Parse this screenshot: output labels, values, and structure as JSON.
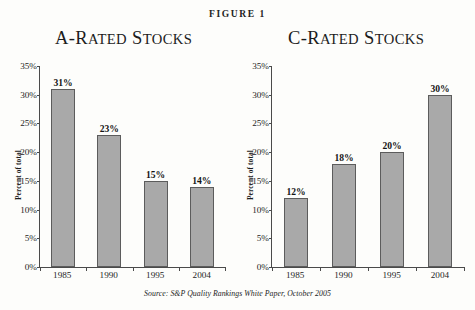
{
  "figure": {
    "label": "FIGURE 1",
    "source_note": "Source: S&P Quality Rankings White Paper, October 2005"
  },
  "panels": [
    {
      "title_lead": "A-R",
      "title_small_1": "ATED",
      "title_mid": " S",
      "title_small_2": "TOCKS",
      "title_plain": "A-Rated Stocks"
    },
    {
      "title_lead": "C-R",
      "title_small_1": "ATED",
      "title_mid": " S",
      "title_small_2": "TOCKS",
      "title_plain": "C-Rated Stocks"
    }
  ],
  "axis": {
    "ylabel": "Percent of total",
    "yticks": [
      "35%",
      "30%",
      "25%",
      "20%",
      "15%",
      "10%",
      "5%",
      "0%"
    ],
    "xlabels": [
      "1985",
      "1990",
      "1995",
      "2004"
    ]
  },
  "colors": {
    "bar_fill": "#a9a9a9",
    "bar_border": "#5c5c5c",
    "axis": "#4a4a4a",
    "background": "#fdfdfb",
    "text": "#1a1a1a"
  },
  "chart_data": [
    {
      "type": "bar",
      "title": "A-Rated Stocks",
      "categories": [
        "1985",
        "1990",
        "1995",
        "2004"
      ],
      "values": [
        31,
        23,
        15,
        14
      ],
      "labels": [
        "31%",
        "23%",
        "15%",
        "14%"
      ],
      "xlabel": "",
      "ylabel": "Percent of total",
      "ylim": [
        0,
        35
      ],
      "ytick_step": 5,
      "unit": "%",
      "grid": false,
      "legend": false
    },
    {
      "type": "bar",
      "title": "C-Rated Stocks",
      "categories": [
        "1985",
        "1990",
        "1995",
        "2004"
      ],
      "values": [
        12,
        18,
        20,
        30
      ],
      "labels": [
        "12%",
        "18%",
        "20%",
        "30%"
      ],
      "xlabel": "",
      "ylabel": "Percent of total",
      "ylim": [
        0,
        35
      ],
      "ytick_step": 5,
      "unit": "%",
      "grid": false,
      "legend": false
    }
  ]
}
